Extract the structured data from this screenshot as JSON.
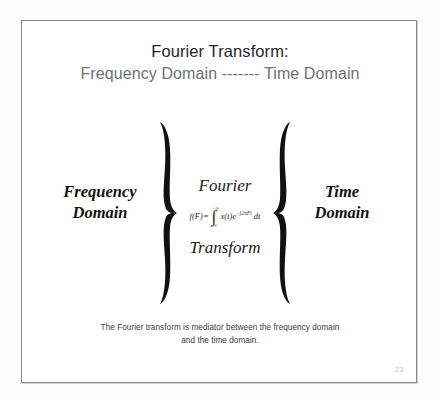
{
  "slide": {
    "title_main": "Fourier Transform:",
    "title_sub": "Frequency Domain ------- Time Domain",
    "page_number": "23",
    "frame_color": "#8a8a8d",
    "background_color": "#ffffff"
  },
  "diagram": {
    "left_label_line1": "Frequency",
    "left_label_line2": "Domain",
    "right_label_line1": "Time",
    "right_label_line2": "Domain",
    "left_brace": "}",
    "right_brace": "{",
    "center_word_top": "Fourier",
    "center_word_bottom": "Transform",
    "formula": {
      "lhs": "f(F)",
      "equals": "=",
      "integral_upper_limit": "+∞",
      "integral_lower_limit": "−∞",
      "integrand_function": "x(t)",
      "integrand_exponential_base": "e",
      "integrand_exponential_power": "−j2πFt",
      "differential": "dt",
      "plain_text": "f(F) = ∫ x(t)e^(−j2πFt) dt"
    }
  },
  "caption": {
    "line1": "The Fourier transform is mediator between the frequency domain",
    "line2": "and the time domain."
  }
}
